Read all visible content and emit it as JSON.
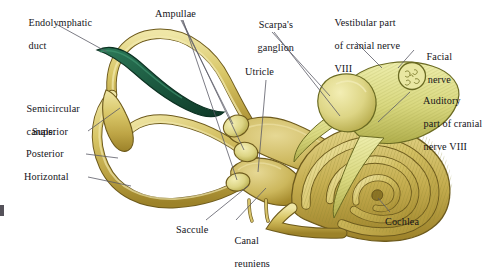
{
  "figure": {
    "background_color": "#ffffff",
    "text_color": "#15141a",
    "leader_line_color": "#5a5a66"
  },
  "palette": {
    "canal_light": "#e8dc8e",
    "canal_mid": "#cdbb55",
    "canal_dark": "#a88f2e",
    "canal_outline": "#6d5a1c",
    "endolymphatic_green": "#1d5c42",
    "endolymphatic_green_dark": "#103b2a",
    "nerve_pale": "#e6e79a",
    "nerve_mid": "#cfcf72",
    "nerve_stripe": "#8d8c33",
    "ganglion": "#e4e59b",
    "cochlea_gold": "#c9b052"
  },
  "labels": [
    {
      "id": "endolymphatic-duct",
      "lines": [
        "Endolymphatic",
        "duct"
      ]
    },
    {
      "id": "semicircular-canals",
      "lines": [
        "Semicircular",
        "canals:"
      ]
    },
    {
      "id": "superior-canal",
      "lines": [
        "Superior"
      ]
    },
    {
      "id": "posterior-canal",
      "lines": [
        "Posterior"
      ]
    },
    {
      "id": "horizontal-canal",
      "lines": [
        "Horizontal"
      ]
    },
    {
      "id": "ampullae",
      "lines": [
        "Ampullae"
      ]
    },
    {
      "id": "scarpas-ganglion",
      "lines": [
        "Scarpa's",
        "ganglion"
      ]
    },
    {
      "id": "utricle",
      "lines": [
        "Utricle"
      ]
    },
    {
      "id": "vestibular-part-cranial-nerve",
      "lines": [
        "Vestibular part",
        "of cranial nerve",
        "VIII"
      ]
    },
    {
      "id": "facial-nerve",
      "lines": [
        "Facial",
        "nerve"
      ]
    },
    {
      "id": "auditory-part-cranial-nerve",
      "lines": [
        "Auditory",
        "part of cranial",
        "nerve VIII"
      ]
    },
    {
      "id": "saccule",
      "lines": [
        "Saccule"
      ]
    },
    {
      "id": "canal-reuniens",
      "lines": [
        "Canal",
        "reuniens"
      ]
    },
    {
      "id": "cochlea",
      "lines": [
        "Cochlea"
      ]
    }
  ],
  "text": {
    "endolymphatic_duct_l1": "Endolymphatic",
    "endolymphatic_duct_l2": "duct",
    "semicircular_canals_l1": "Semicircular",
    "semicircular_canals_l2": "canals:",
    "superior": "Superior",
    "posterior": "Posterior",
    "horizontal": "Horizontal",
    "ampullae": "Ampullae",
    "scarpas_l1": "Scarpa's",
    "scarpas_l2": "ganglion",
    "utricle": "Utricle",
    "vestibular_l1": "Vestibular part",
    "vestibular_l2": "of cranial nerve",
    "vestibular_l3": "VIII",
    "facial_l1": "Facial",
    "facial_l2": "nerve",
    "auditory_l1": "Auditory",
    "auditory_l2": "part of cranial",
    "auditory_l3": "nerve VIII",
    "saccule": "Saccule",
    "canal_reuniens_l1": "Canal",
    "canal_reuniens_l2": "reuniens",
    "cochlea": "Cochlea"
  }
}
